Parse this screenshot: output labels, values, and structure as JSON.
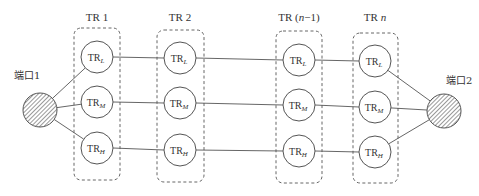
{
  "diagram": {
    "ports": [
      {
        "id": "port1",
        "label": "端口1"
      },
      {
        "id": "port2",
        "label": "端口2"
      }
    ],
    "stages": [
      {
        "id": "tr1",
        "label_main": "TR 1",
        "label_italic": ""
      },
      {
        "id": "tr2",
        "label_main": "TR 2",
        "label_italic": ""
      },
      {
        "id": "trn1",
        "label_main": "TR (",
        "label_italic": "n",
        "label_tail": "−1)"
      },
      {
        "id": "trn",
        "label_main": "TR ",
        "label_italic": "n"
      }
    ],
    "node_base": "TR",
    "node_subscripts": [
      "L",
      "M",
      "H"
    ]
  }
}
